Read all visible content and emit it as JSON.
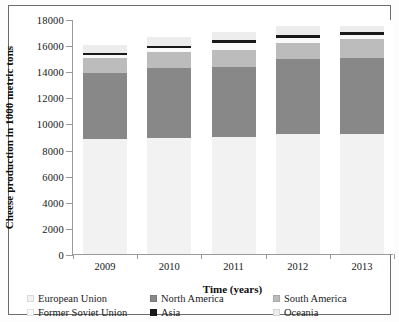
{
  "chart_data": {
    "type": "bar",
    "subtype": "stacked-bar",
    "title": "",
    "xlabel": "Time (years)",
    "ylabel": "Cheese production in 1000 metric tons",
    "categories": [
      "2009",
      "2010",
      "2011",
      "2012",
      "2013"
    ],
    "ylim": [
      0,
      18000
    ],
    "yticks": [
      0,
      2000,
      4000,
      6000,
      8000,
      10000,
      12000,
      14000,
      16000,
      18000
    ],
    "ytick_labels": [
      "0",
      "2000",
      "4000",
      "6000",
      "8000",
      "10000",
      "12000",
      "14000",
      "16000",
      "18000"
    ],
    "grid": false,
    "legend_position": "bottom",
    "series": [
      {
        "name": "European Union",
        "color": "#f2f2f2",
        "values": [
          8800,
          8900,
          9000,
          9200,
          9200
        ]
      },
      {
        "name": "North America",
        "color": "#888888",
        "values": [
          5100,
          5350,
          5350,
          5700,
          5850
        ]
      },
      {
        "name": "South America",
        "color": "#bcbcbc",
        "values": [
          1100,
          1250,
          1250,
          1250,
          1400
        ]
      },
      {
        "name": "Former Soviet Union",
        "color": "#fafafa",
        "values": [
          250,
          250,
          600,
          400,
          350
        ]
      },
      {
        "name": "Asia",
        "color": "#1a1a1a",
        "values": [
          150,
          200,
          180,
          200,
          200
        ]
      },
      {
        "name": "Oceania",
        "color": "#ededed",
        "values": [
          600,
          700,
          600,
          700,
          500
        ]
      }
    ],
    "totals": [
      16000,
      16650,
      16980,
      17450,
      17500
    ]
  },
  "axes": {
    "y_title": "Cheese production in 1000 metric tons",
    "x_title": "Time (years)"
  },
  "legend": {
    "items": [
      {
        "label": "European Union",
        "color": "#f2f2f2"
      },
      {
        "label": "North America",
        "color": "#888888"
      },
      {
        "label": "South America",
        "color": "#bcbcbc"
      },
      {
        "label": "Former Soviet Union",
        "color": "#fafafa"
      },
      {
        "label": "Asia",
        "color": "#1a1a1a"
      },
      {
        "label": "Oceania",
        "color": "#ededed"
      }
    ]
  }
}
